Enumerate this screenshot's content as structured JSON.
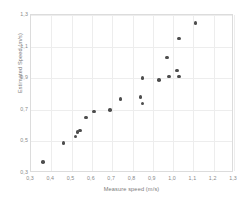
{
  "chart_data": {
    "type": "scatter",
    "title": "",
    "xlabel": "Measure speed (m/s)",
    "ylabel": "Estimated Speed (m/s)",
    "xlim": [
      0.3,
      1.3
    ],
    "ylim": [
      0.3,
      1.3
    ],
    "xticks": [
      "0,3",
      "0,4",
      "0,5",
      "0,6",
      "0,7",
      "0,8",
      "0,9",
      "1,0",
      "1,1",
      "1,2",
      "1,3"
    ],
    "xtick_values": [
      0.3,
      0.4,
      0.5,
      0.6,
      0.7,
      0.8,
      0.9,
      1.0,
      1.1,
      1.2,
      1.3
    ],
    "yticks": [
      "0,3",
      "0,5",
      "0,7",
      "0,9",
      "1,1",
      "1,3"
    ],
    "ytick_values": [
      0.3,
      0.5,
      0.7,
      0.9,
      1.1,
      1.3
    ],
    "grid": true,
    "grid_color": "#ededed",
    "frame_color": "#dcdcdc",
    "marker_color": "#4d4d4d",
    "marker_size": 3.6,
    "legend": null,
    "decimal_separator": ",",
    "points": [
      {
        "x": 0.36,
        "y": 0.37
      },
      {
        "x": 0.46,
        "y": 0.49
      },
      {
        "x": 0.52,
        "y": 0.53
      },
      {
        "x": 0.53,
        "y": 0.56
      },
      {
        "x": 0.54,
        "y": 0.57
      },
      {
        "x": 0.57,
        "y": 0.65
      },
      {
        "x": 0.61,
        "y": 0.69
      },
      {
        "x": 0.69,
        "y": 0.7
      },
      {
        "x": 0.74,
        "y": 0.77
      },
      {
        "x": 0.84,
        "y": 0.78
      },
      {
        "x": 0.85,
        "y": 0.74
      },
      {
        "x": 0.85,
        "y": 0.9
      },
      {
        "x": 0.93,
        "y": 0.89
      },
      {
        "x": 0.97,
        "y": 1.03
      },
      {
        "x": 0.98,
        "y": 0.91
      },
      {
        "x": 1.02,
        "y": 0.95
      },
      {
        "x": 1.03,
        "y": 0.91
      },
      {
        "x": 1.03,
        "y": 1.15
      },
      {
        "x": 1.11,
        "y": 1.25
      }
    ]
  }
}
